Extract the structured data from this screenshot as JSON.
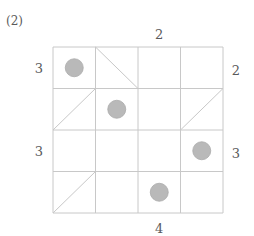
{
  "problem_label": "(2)",
  "grid": {
    "rows": 4,
    "cols": 4,
    "x0": 53,
    "y0": 47,
    "x1": 223,
    "y1": 213,
    "line_color": "#c8c8c8"
  },
  "clues": {
    "top": [
      {
        "col": 3,
        "value": "2"
      }
    ],
    "bottom": [
      {
        "col": 3,
        "value": "4"
      }
    ],
    "left": [
      {
        "row": 1,
        "value": "3"
      },
      {
        "row": 3,
        "value": "3"
      }
    ],
    "right": [
      {
        "row": 1,
        "value": "2"
      },
      {
        "row": 3,
        "value": "3"
      }
    ]
  },
  "circles": [
    {
      "row": 1,
      "col": 1
    },
    {
      "row": 2,
      "col": 2
    },
    {
      "row": 3,
      "col": 4
    },
    {
      "row": 4,
      "col": 3
    }
  ],
  "circle_style": {
    "fill": "#b9b9b9",
    "stroke": "#a9a9a9"
  },
  "diagonals": [
    {
      "row": 1,
      "col": 2,
      "dir": "backslash"
    },
    {
      "row": 2,
      "col": 1,
      "dir": "slash"
    },
    {
      "row": 2,
      "col": 4,
      "dir": "slash"
    },
    {
      "row": 4,
      "col": 1,
      "dir": "slash"
    }
  ]
}
